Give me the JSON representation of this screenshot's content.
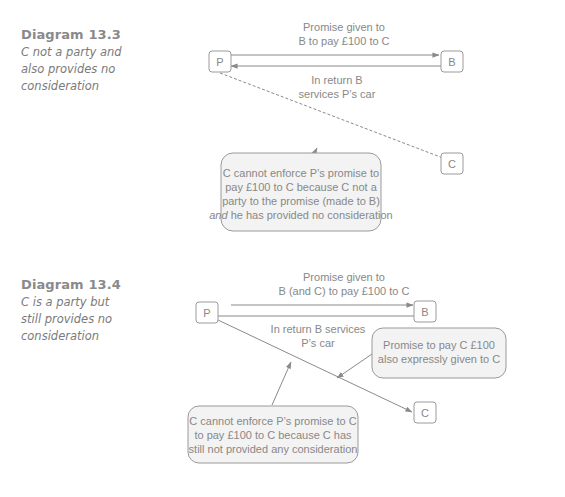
{
  "diagrams": [
    {
      "title": "Diagram 13.3",
      "subtitle_lines": [
        "C not a party and",
        "also provides no",
        "consideration"
      ],
      "nodes": {
        "p": "P",
        "b": "B",
        "c": "C"
      },
      "promise_label": [
        "Promise given to",
        "B to pay £100 to C"
      ],
      "return_label": [
        "In return B",
        "services P’s car"
      ],
      "note_lines": [
        [
          {
            "t": "C cannot enforce P’s promise to",
            "i": false
          }
        ],
        [
          {
            "t": "pay £100 to C because C not a",
            "i": false
          }
        ],
        [
          {
            "t": "party to the promise (made to B)",
            "i": false
          }
        ],
        [
          {
            "t": "and",
            "i": true
          },
          {
            "t": " he has provided no consideration",
            "i": false
          }
        ]
      ]
    },
    {
      "title": "Diagram 13.4",
      "subtitle_lines": [
        "C is a party but",
        "still provides no",
        "consideration"
      ],
      "nodes": {
        "p": "P",
        "b": "B",
        "c": "C"
      },
      "promise_label": [
        "Promise given to",
        "B (and C) to pay £100 to C"
      ],
      "return_label": [
        "In return B services",
        "P’s car"
      ],
      "side_note_lines": [
        "Promise to pay C £100",
        "also expressly given to C"
      ],
      "note_lines": [
        "C cannot enforce P’s promise to C",
        "to pay £100 to C because C has",
        "still not provided any consideration"
      ]
    }
  ]
}
